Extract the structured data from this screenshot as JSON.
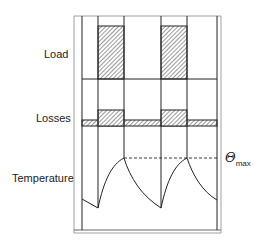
{
  "labels": {
    "load": "Load",
    "losses": "Losses",
    "temperature": "Temperature",
    "theta_symbol": "Θ",
    "theta_subscript": "max"
  },
  "colors": {
    "line": "#222222",
    "frame": "#888888",
    "hatch": "#555555"
  },
  "diagram": {
    "rows": [
      "Load",
      "Losses",
      "Temperature"
    ],
    "load_blocks": [
      {
        "x_start": 98,
        "x_end": 124
      },
      {
        "x_start": 161,
        "x_end": 187
      }
    ],
    "annotation": "Θmax dashed line marks peak temperature"
  }
}
